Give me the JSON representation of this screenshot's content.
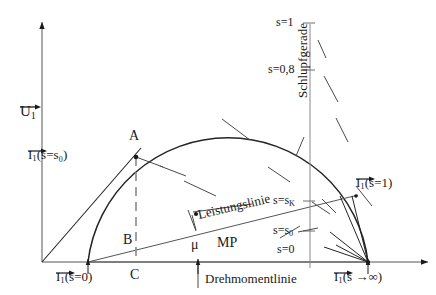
{
  "figure": {
    "kind": "heyland-ossanna-circle-diagram",
    "axes": {
      "y_label": "U",
      "y_label_sub": "1",
      "x_label": "",
      "origin_label": ""
    },
    "points": {
      "a": "A",
      "b": "B",
      "c": "C",
      "mu": "μ",
      "mp": "MP"
    },
    "current_labels": {
      "s_zero": {
        "sym": "I",
        "sub": "1",
        "arg": "(s=0)"
      },
      "s_s0": {
        "sym": "I",
        "sub": "1",
        "arg": "(s=s₀)"
      },
      "s_one": {
        "sym": "I",
        "sub": "1",
        "arg": "(s=1)"
      },
      "s_inf": {
        "sym": "I",
        "sub": "1",
        "arg": "(s →∞)"
      }
    },
    "lines": {
      "slip": "Schlupfgerade",
      "power": "Leistungslinie",
      "torque": "Drehmomentlinie"
    },
    "slip_scale": {
      "ticks": [
        {
          "label": "s=1",
          "value": 1.0
        },
        {
          "label": "s=0,8",
          "value": 0.8
        },
        {
          "label": "s=s",
          "sub": "K"
        },
        {
          "label": "s=s",
          "sub": "0"
        },
        {
          "label": "s=0",
          "value": 0.0
        }
      ],
      "t_s1": "s=1",
      "t_s08": "s=0,8",
      "t_sk_main": "s=s",
      "t_sk_sub": "K",
      "t_s0_main": "s=s",
      "t_s0_sub": "0",
      "t_szero": "s=0"
    },
    "colors": {
      "ink": "#1a1a1a",
      "curve": "#242424",
      "thin": "#6f6f6f",
      "background": "#ffffff"
    }
  }
}
